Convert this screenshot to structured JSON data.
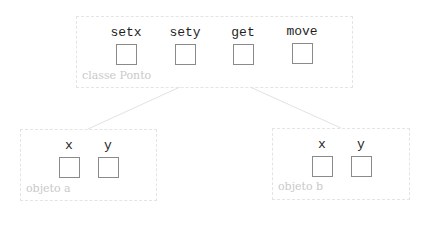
{
  "diagram": {
    "class_box": {
      "caption": "classe Ponto",
      "members": [
        {
          "label": "setx"
        },
        {
          "label": "sety"
        },
        {
          "label": "get"
        },
        {
          "label": "move"
        }
      ]
    },
    "objects": [
      {
        "caption": "objeto a",
        "members": [
          {
            "label": "x"
          },
          {
            "label": "y"
          }
        ]
      },
      {
        "caption": "objeto b",
        "members": [
          {
            "label": "x"
          },
          {
            "label": "y"
          }
        ]
      }
    ],
    "colors": {
      "frame_border": "#e4e4e4",
      "caption": "#c9c9c9",
      "slot_border": "#8a8a8a",
      "label": "#1e1e1e",
      "link": "#e2e2e2"
    }
  }
}
